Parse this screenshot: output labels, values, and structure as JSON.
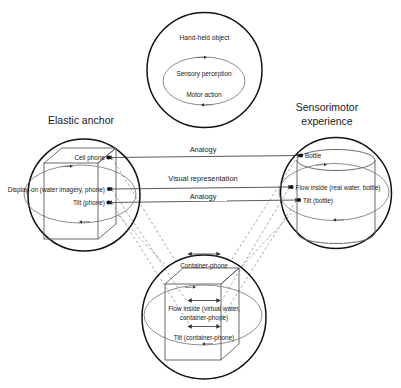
{
  "circles": {
    "top": {
      "label": "Hand-held object",
      "inner_loop": {
        "top_label": "Sensory perception",
        "bottom_label": "Motor action"
      }
    },
    "left": {
      "title": "Elastic anchor",
      "shape": "cube",
      "nodes": [
        {
          "label": "Cell phone"
        },
        {
          "label": "Display-on (water imagery, phone)"
        },
        {
          "label": "Tilt (phone)"
        }
      ]
    },
    "right": {
      "title": "Sensorimotor experience",
      "title_line1": "Sensorimotor",
      "title_line2": "experience",
      "shape": "cylinder",
      "nodes": [
        {
          "label": "Bottle"
        },
        {
          "label": "Flow inside (real water, bottle)"
        },
        {
          "label": "Tilt (bottle)"
        }
      ]
    },
    "bottom": {
      "shape": "cube",
      "nodes": [
        {
          "label": "Container-phone"
        },
        {
          "label": "Flow inside (virtual water,",
          "label_line2": "container-phone)"
        },
        {
          "label": "Tilt (container-phone)"
        }
      ]
    }
  },
  "connectors": [
    {
      "id": "analogy-top",
      "label": "Analogy"
    },
    {
      "id": "visual-representation",
      "label": "Visual representation"
    },
    {
      "id": "analogy-bottom",
      "label": "Analogy"
    }
  ],
  "colors": {
    "outline": "#111111",
    "inner_shape": "#6e6e6e",
    "connector": "#4a4a4a",
    "dashed": "#8a8a8a",
    "background": "#ffffff"
  }
}
